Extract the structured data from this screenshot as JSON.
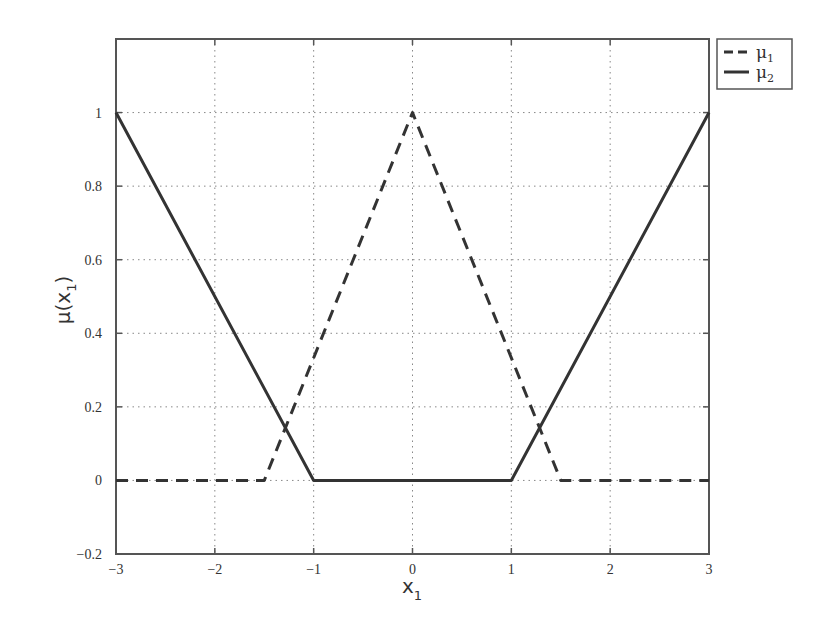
{
  "chart_data": {
    "type": "line",
    "title": "",
    "xlabel": "x",
    "xlabel_subscript": "1",
    "ylabel": "μ(x",
    "ylabel_subscript": "1",
    "ylabel_suffix": ")",
    "xlim": [
      -3,
      3
    ],
    "ylim": [
      -0.2,
      1.2
    ],
    "grid": true,
    "legend_position": "outside-top-right",
    "x_ticks": [
      -3,
      -2,
      -1,
      0,
      1,
      2,
      3
    ],
    "x_tick_labels": [
      "−3",
      "−2",
      "−1",
      "0",
      "1",
      "2",
      "3"
    ],
    "y_ticks": [
      -0.2,
      0,
      0.2,
      0.4,
      0.6,
      0.8,
      1
    ],
    "y_tick_labels": [
      "−0.2",
      "0",
      "0.2",
      "0.4",
      "0.6",
      "0.8",
      "1"
    ],
    "series": [
      {
        "name": "μ1",
        "label": "μ",
        "subscript": "1",
        "style": "dashed",
        "color": "#333333",
        "x": [
          -3,
          -1.5,
          0,
          1.5,
          3
        ],
        "y": [
          0,
          0,
          1,
          0,
          0
        ]
      },
      {
        "name": "μ2",
        "label": "μ",
        "subscript": "2",
        "style": "solid",
        "color": "#333333",
        "x": [
          -3,
          -1,
          1,
          3
        ],
        "y": [
          1,
          0,
          0,
          1
        ]
      }
    ]
  }
}
